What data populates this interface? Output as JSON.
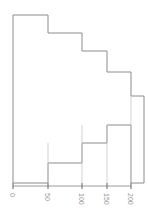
{
  "figure": {
    "type": "spine-plot",
    "background_color": "#ffffff",
    "outline_color": "#8c8c8c",
    "axis_color": "#9a9a9a",
    "tick_color": "#7a7a7a",
    "label_color": "#9a9a9a",
    "width": 148,
    "height": 218
  },
  "axis": {
    "name": "x-axis",
    "orientation": "horizontal",
    "line_y": 186,
    "x_start": 13,
    "x_end": 131,
    "label_rotation_degrees": 90,
    "ticks": [
      {
        "label": "0",
        "value": 0,
        "x": 13
      },
      {
        "label": "50",
        "value": 50,
        "x": 48
      },
      {
        "label": "100",
        "value": 100,
        "x": 82
      },
      {
        "label": "150",
        "value": 150,
        "x": 107
      },
      {
        "label": "200",
        "value": 200,
        "x": 131
      }
    ]
  },
  "chart_data": {
    "type": "bar",
    "title": "",
    "subtitle": "",
    "xlabel": "",
    "ylabel": "",
    "xlim": [
      0,
      200
    ],
    "ylim": [
      0,
      1
    ],
    "grid": false,
    "legend": false,
    "legend_position": "none",
    "orientation": "vertical-spine",
    "note": "Spine / mosaic style plot: five adjacent columns of varying width and height drawn as one continuous outline.",
    "categories": [
      "0-50",
      "50-100",
      "100-150",
      "150-175",
      "175-200"
    ],
    "x_edges": [
      0,
      50,
      100,
      150,
      175,
      200
    ],
    "x_edges_px": [
      13,
      48,
      82,
      107,
      131,
      144
    ],
    "bars": [
      {
        "category": "0-50",
        "x_left_px": 13,
        "x_right_px": 48,
        "top_px": 15,
        "bottom_px": 163,
        "height_px": 148,
        "value": 1.0
      },
      {
        "category": "50-100",
        "x_left_px": 48,
        "x_right_px": 82,
        "top_px": 33,
        "bottom_px": 143,
        "height_px": 110,
        "value": 0.74
      },
      {
        "category": "100-150",
        "x_left_px": 82,
        "x_right_px": 107,
        "top_px": 51,
        "bottom_px": 125,
        "height_px": 74,
        "value": 0.5
      },
      {
        "category": "150-175",
        "x_left_px": 107,
        "x_right_px": 131,
        "top_px": 72,
        "bottom_px": 183,
        "height_px": 111,
        "value": 0.75
      },
      {
        "category": "175-200",
        "x_left_px": 131,
        "x_right_px": 144,
        "top_px": 96,
        "bottom_px": 183,
        "height_px": 87,
        "value": 0.59
      }
    ],
    "values": [
      1.0,
      0.74,
      0.5,
      0.75,
      0.59
    ],
    "outline_path": "M 13 15 L 48 15 L 48 33 L 82 33 L 82 51 L 107 51 L 107 72 L 131 72 L 131 96 L 144 96 L 144 183 L 131 183 L 131 125 L 107 125 L 107 143 L 82 143 L 82 163 L 48 163 L 48 183 L 13 183 Z"
  }
}
